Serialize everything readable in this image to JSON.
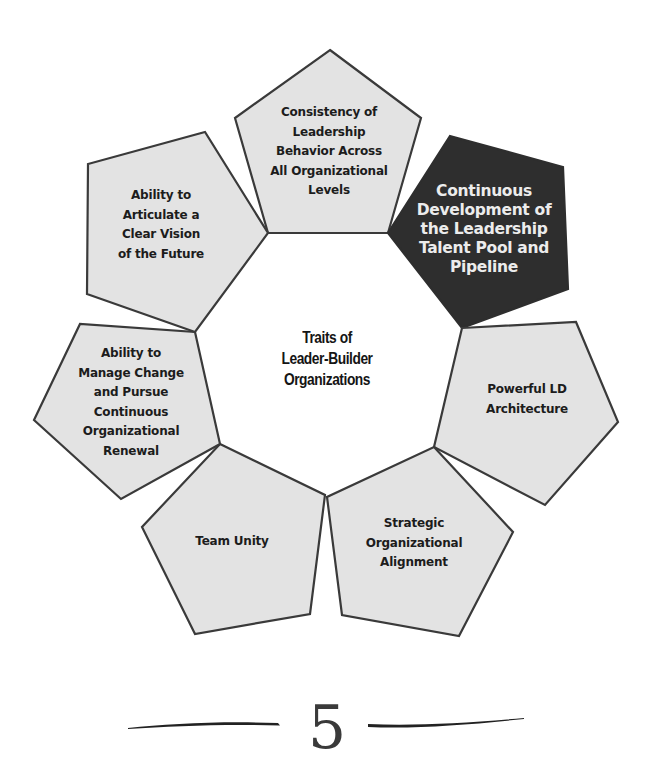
{
  "diagram": {
    "title": "Traits of Leader-Builder Organizations",
    "center": {
      "label_lines": [
        "Traits of",
        "Leader-Builder",
        "Organizations"
      ],
      "x": 327,
      "y": 355
    },
    "colors": {
      "pentagon_fill": "#e3e3e3",
      "pentagon_stroke": "#3a3a3a",
      "highlight_fill": "#2e2e2e",
      "highlight_text": "#ececec",
      "text": "#1c1c1c",
      "background": "#ffffff"
    },
    "traits": [
      {
        "id": "consistency",
        "label": "Consistency of Leadership Behavior Across All Organizational Levels",
        "lines": [
          "Consistency of",
          "Leadership",
          "Behavior Across",
          "All Organizational",
          "Levels"
        ],
        "highlighted": false,
        "points": "330,50 421,118 388,233 268,233 235,118",
        "text_x": 329,
        "text_y": 152
      },
      {
        "id": "continuous-development",
        "label": "Continuous Development of the Leadership Talent Pool and Pipeline",
        "lines": [
          "Continuous",
          "Development of",
          "the Leadership",
          "Talent Pool and",
          "Pipeline"
        ],
        "highlighted": true,
        "points": "450,136 563,167 568,289 462,328 388,233",
        "text_x": 484,
        "text_y": 229
      },
      {
        "id": "ld-architecture",
        "label": "Powerful LD Architecture",
        "lines": [
          "Powerful LD",
          "Architecture"
        ],
        "highlighted": false,
        "points": "462,328 576,322 618,422 545,505 434,447",
        "text_x": 527,
        "text_y": 399
      },
      {
        "id": "strategic-alignment",
        "label": "Strategic Organizational Alignment",
        "lines": [
          "Strategic",
          "Organizational",
          "Alignment"
        ],
        "highlighted": false,
        "points": "434,447 513,532 459,636 342,615 327,497",
        "text_x": 414,
        "text_y": 543
      },
      {
        "id": "team-unity",
        "label": "Team Unity",
        "lines": [
          "Team Unity"
        ],
        "highlighted": false,
        "points": "220,444 325,495 310,614 195,634 142,527",
        "text_x": 232,
        "text_y": 542
      },
      {
        "id": "manage-change",
        "label": "Ability to Manage Change and Pursue Continuous Organizational Renewal",
        "lines": [
          "Ability to",
          "Manage Change",
          "and Pursue",
          "Continuous",
          "Organizational",
          "Renewal"
        ],
        "highlighted": false,
        "points": "220,444 121,499 34,420 80,324 195,332",
        "text_x": 131,
        "text_y": 402
      },
      {
        "id": "clear-vision",
        "label": "Ability to Articulate a Clear Vision of the Future",
        "lines": [
          "Ability to",
          "Articulate a",
          "Clear Vision",
          "of the Future"
        ],
        "highlighted": false,
        "points": "195,332 87,294 88,164 205,132 268,233",
        "text_x": 161,
        "text_y": 225
      }
    ]
  },
  "footer": {
    "page_number": "5"
  }
}
